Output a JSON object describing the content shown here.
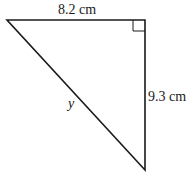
{
  "diagram": {
    "type": "right-triangle",
    "labels": {
      "top_side": "8.2 cm",
      "right_side": "9.3 cm",
      "hypotenuse": "y"
    },
    "right_angle_marker": true,
    "stroke_color": "#1a1a1a"
  }
}
